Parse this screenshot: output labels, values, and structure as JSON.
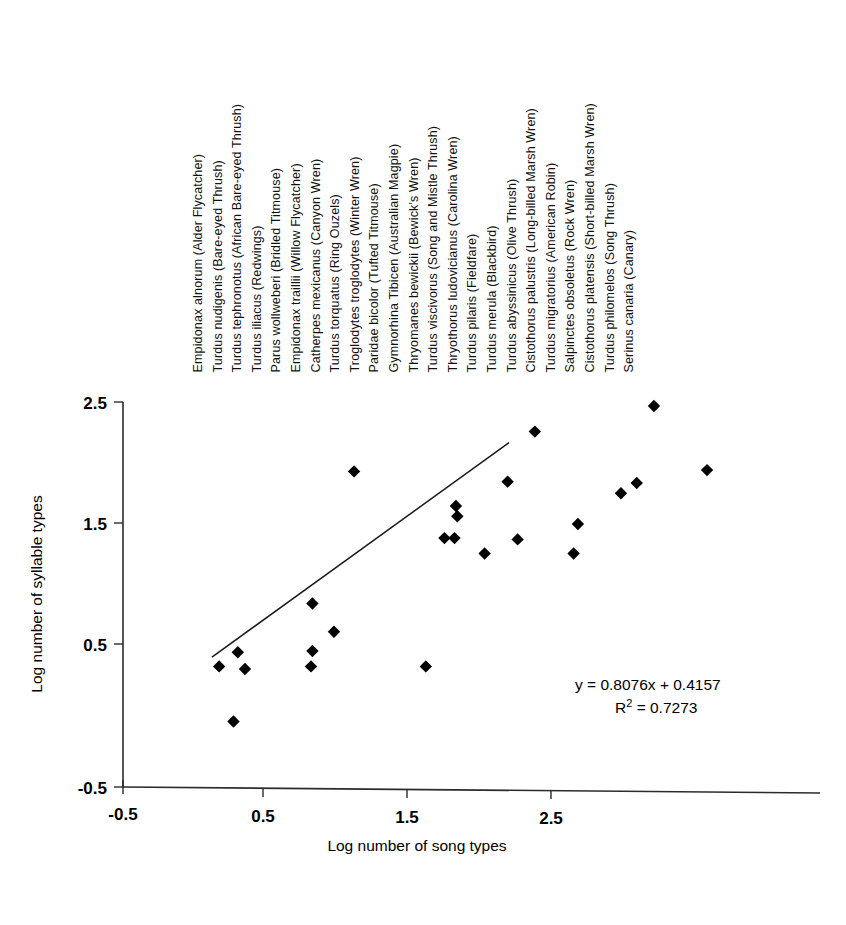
{
  "chart_data": {
    "type": "scatter",
    "title": "",
    "xlabel": "Log number of song types",
    "ylabel": "Log number of syllable types",
    "xlim": [
      -0.5,
      3.0
    ],
    "ylim": [
      -0.5,
      2.5
    ],
    "x_ticks": [
      "-0.5",
      "0.5",
      "1.5",
      "2.5"
    ],
    "x_tick_values": [
      -0.5,
      0.5,
      1.5,
      2.5
    ],
    "y_ticks": [
      "-0.5",
      "0.5",
      "1.5",
      "2.5"
    ],
    "y_tick_values": [
      -0.5,
      2.5,
      1.5,
      0.5
    ],
    "grid": false,
    "legend": "none",
    "marker": "diamond",
    "marker_color": "#000000",
    "points": [
      {
        "x": 0.17,
        "y": 0.44,
        "label": "Empidonax alnorum (Alder Flycatcher)"
      },
      {
        "x": 0.3,
        "y": 0.55,
        "label": "Turdus nudigenis (Bare-eyed Thrush)"
      },
      {
        "x": 0.35,
        "y": 0.42,
        "label": "Turdus tephronotus (African Bare-eyed Thrush)"
      },
      {
        "x": 0.27,
        "y": 0.01,
        "label": "Turdus iliacus (Redwings)"
      },
      {
        "x": 0.82,
        "y": 0.93,
        "label": "Parus wollweberi (Bridled Titmouse)"
      },
      {
        "x": 0.82,
        "y": 0.56,
        "label": "Empidonax traillii (Willow Flycatcher)"
      },
      {
        "x": 0.81,
        "y": 0.44,
        "label": "Catherpes mexicanus (Canyon Wren)"
      },
      {
        "x": 0.97,
        "y": 0.71,
        "label": "Turdus torquatus (Ring Ouzels)"
      },
      {
        "x": 1.11,
        "y": 1.96,
        "label": "Troglodytes troglodytes (Winter Wren)"
      },
      {
        "x": 1.61,
        "y": 0.44,
        "label": "Paridae bicolor (Tufted Titmouse)"
      },
      {
        "x": 1.81,
        "y": 1.44,
        "label": "Gymnorhina Tibicen (Australian Magpie)"
      },
      {
        "x": 1.82,
        "y": 1.69,
        "label": "Thryomanes bewickii (Bewick's Wren)"
      },
      {
        "x": 1.83,
        "y": 1.61,
        "label": "Turdus viscivorus (Song and Mistle Thrush)"
      },
      {
        "x": 1.74,
        "y": 1.44,
        "label": "Thryothorus ludovicianus (Carolina Wren)"
      },
      {
        "x": 2.02,
        "y": 1.32,
        "label": "Turdus pilaris (Fieldfare)"
      },
      {
        "x": 2.18,
        "y": 1.88,
        "label": "Turdus merula (Blackbird)"
      },
      {
        "x": 2.37,
        "y": 2.27,
        "label": "Turdus abyssinicus (Olive Thrush)"
      },
      {
        "x": 2.25,
        "y": 1.43,
        "label": "Cistothorus palustris (Long-billed Marsh Wren)"
      },
      {
        "x": 2.67,
        "y": 1.55,
        "label": "Turdus migratorius (American Robin)"
      },
      {
        "x": 2.97,
        "y": 1.79,
        "label": "Salpinctes obsoletus (Rock Wren)"
      },
      {
        "x": 3.08,
        "y": 1.87,
        "label": "Cistothorus platensis (Short-billed Marsh Wren)"
      },
      {
        "x": 3.2,
        "y": 2.47,
        "label": "Turdus philomelos (Song Thrush)"
      },
      {
        "x": 3.57,
        "y": 1.97,
        "label": "Serinus canaria (Canary)"
      },
      {
        "x": 2.64,
        "y": 1.32,
        "label": ""
      }
    ],
    "trendline": {
      "equation": "y = 0.8076x + 0.4157",
      "r_squared_label": "R",
      "r_squared_sup": "2",
      "r_squared_value": " = 0.7273",
      "slope": 0.8076,
      "intercept": 0.4157,
      "r_squared": 0.7273,
      "x_start": 0.12,
      "x_end": 2.19
    }
  },
  "species_legend": {
    "items": [
      "Empidonax alnorum (Alder Flycatcher)",
      "Turdus nudigenis (Bare-eyed Thrush)",
      "Turdus tephronotus (African Bare-eyed Thrush)",
      "Turdus iliacus (Redwings)",
      "Parus wollweberi (Bridled Titmouse)",
      "Empidonax traillii (Willow Flycatcher)",
      "Catherpes mexicanus (Canyon Wren)",
      "Turdus torquatus (Ring Ouzels)",
      "Troglodytes troglodytes (Winter Wren)",
      "Paridae bicolor (Tufted Titmouse)",
      "Gymnorhina Tibicen (Australian Magpie)",
      "Thryomanes bewickii (Bewick's Wren)",
      "Turdus viscivorus (Song and Mistle Thrush)",
      "Thryothorus ludovicianus (Carolina Wren)",
      "Turdus pilaris (Fieldfare)",
      "Turdus merula (Blackbird)",
      "Turdus abyssinicus (Olive Thrush)",
      "Cistothorus palustris (Long-billed Marsh Wren)",
      "Turdus migratorius (American Robin)",
      "Salpinctes obsoletus (Rock Wren)",
      "Cistothorus platensis (Short-billed Marsh Wren)",
      "Turdus philomelos (Song Thrush)",
      "Serinus canaria (Canary)"
    ]
  }
}
